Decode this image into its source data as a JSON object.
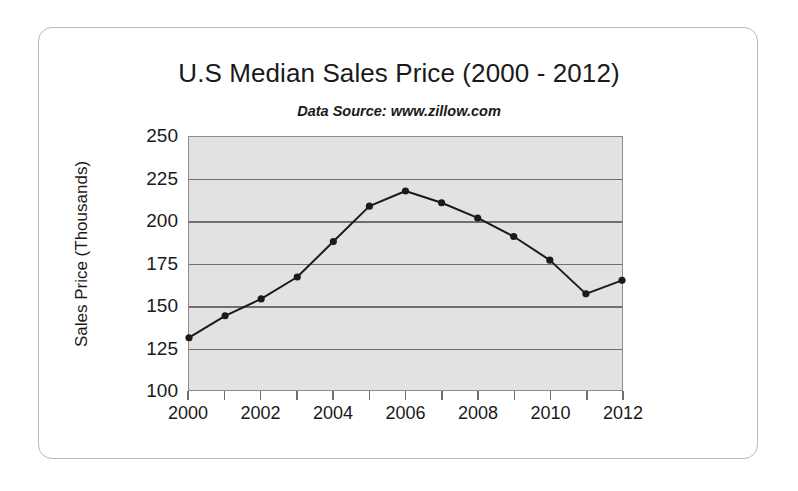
{
  "chart_data": {
    "type": "line",
    "title": "U.S Median Sales Price (2000 - 2012)",
    "subtitle": "Data Source: www.zillow.com",
    "xlabel": "",
    "ylabel": "Sales Price (Thousands)",
    "x": [
      2000,
      2001,
      2002,
      2003,
      2004,
      2005,
      2006,
      2007,
      2008,
      2009,
      2010,
      2011,
      2012
    ],
    "values": [
      131,
      144,
      154,
      167,
      188,
      209,
      218,
      211,
      202,
      191,
      177,
      157,
      165
    ],
    "xlim": [
      2000,
      2012
    ],
    "ylim": [
      100,
      250
    ],
    "ytick_labels": [
      "250",
      "225",
      "200",
      "175",
      "150",
      "125",
      "100"
    ],
    "ytick_values": [
      250,
      225,
      200,
      175,
      150,
      125,
      100
    ],
    "xtick_labels": [
      "2000",
      "2002",
      "2004",
      "2006",
      "2008",
      "2010",
      "2012"
    ],
    "xtick_values": [
      2000,
      2002,
      2004,
      2006,
      2008,
      2010,
      2012
    ],
    "grid": true,
    "legend": false,
    "marker": "circle",
    "colors": {
      "plot_background": "#e2e2e2",
      "gridline": "#6f6f6f",
      "line": "#1a1a1a",
      "marker": "#1a1a1a",
      "axis": "#8d8d8d",
      "text": "#1a1a1a",
      "card_border": "#b9b9b9",
      "page_background": "#ffffff"
    }
  }
}
